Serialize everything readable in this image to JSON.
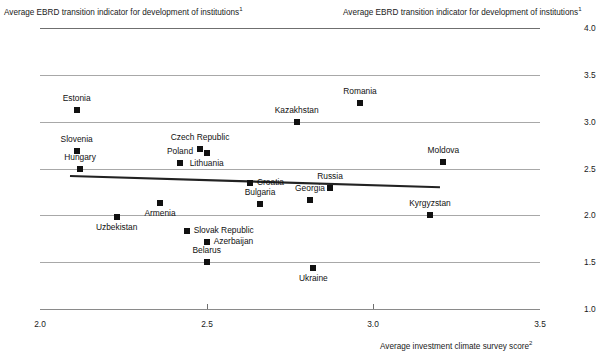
{
  "titles": {
    "left_axis_title": "Average EBRD transition indicator for development of institutions",
    "left_axis_title_sup": "1",
    "right_axis_title": "Average EBRD transition indicator for development of institutions",
    "right_axis_title_sup": "1",
    "x_axis_title": "Average investment climate survey score",
    "x_axis_title_sup": "2"
  },
  "chart_data": {
    "type": "scatter",
    "title": "",
    "xlabel": "Average investment climate survey score²",
    "ylabel": "Average EBRD transition indicator for development of institutions¹",
    "xlim": [
      2.0,
      3.5
    ],
    "ylim": [
      1.0,
      4.0
    ],
    "xticks": [
      "2.0",
      "2.5",
      "3.0",
      "3.5"
    ],
    "yticks": [
      "1.0",
      "1.5",
      "2.0",
      "2.5",
      "3.0",
      "3.5",
      "4.0"
    ],
    "grid": true,
    "legend": "none",
    "points": [
      {
        "label": "Estonia",
        "x": 2.11,
        "y": 3.12,
        "label_pos": "above"
      },
      {
        "label": "Slovenia",
        "x": 2.11,
        "y": 2.69,
        "label_pos": "above"
      },
      {
        "label": "Hungary",
        "x": 2.12,
        "y": 2.5,
        "label_pos": "above"
      },
      {
        "label": "Poland",
        "x": 2.42,
        "y": 2.56,
        "label_pos": "above"
      },
      {
        "label": "Czech Republic",
        "x": 2.48,
        "y": 2.71,
        "label_pos": "above"
      },
      {
        "label": "Lithuania",
        "x": 2.5,
        "y": 2.67,
        "label_pos": "below"
      },
      {
        "label": "Kazakhstan",
        "x": 2.77,
        "y": 3.0,
        "label_pos": "above"
      },
      {
        "label": "Romania",
        "x": 2.96,
        "y": 3.2,
        "label_pos": "above"
      },
      {
        "label": "Moldova",
        "x": 3.21,
        "y": 2.57,
        "label_pos": "above"
      },
      {
        "label": "Croatia",
        "x": 2.63,
        "y": 2.34,
        "label_pos": "right"
      },
      {
        "label": "Russia",
        "x": 2.87,
        "y": 2.29,
        "label_pos": "above"
      },
      {
        "label": "Georgia",
        "x": 2.81,
        "y": 2.16,
        "label_pos": "above"
      },
      {
        "label": "Bulgaria",
        "x": 2.66,
        "y": 2.12,
        "label_pos": "above"
      },
      {
        "label": "Armenia",
        "x": 2.36,
        "y": 2.13,
        "label_pos": "below"
      },
      {
        "label": "Kyrgyzstan",
        "x": 3.17,
        "y": 2.0,
        "label_pos": "above"
      },
      {
        "label": "Uzbekistan",
        "x": 2.23,
        "y": 1.98,
        "label_pos": "below"
      },
      {
        "label": "Slovak Republic",
        "x": 2.44,
        "y": 1.83,
        "label_pos": "right"
      },
      {
        "label": "Azerbaijan",
        "x": 2.5,
        "y": 1.72,
        "label_pos": "right"
      },
      {
        "label": "Belarus",
        "x": 2.5,
        "y": 1.5,
        "label_pos": "above"
      },
      {
        "label": "Ukraine",
        "x": 2.82,
        "y": 1.44,
        "label_pos": "below"
      }
    ],
    "trendline": {
      "x0": 2.09,
      "y0": 2.42,
      "x1": 3.2,
      "y1": 2.3
    }
  }
}
